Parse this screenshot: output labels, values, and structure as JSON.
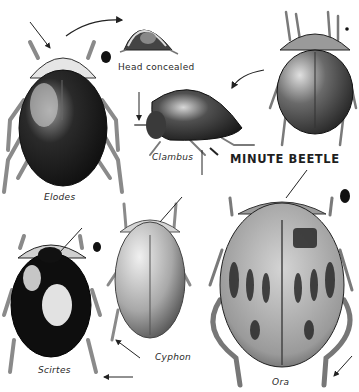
{
  "plate": {
    "title": "MINUTE BEETLE",
    "labels": {
      "head_concealed": "Head concealed",
      "clambus": "Clambus",
      "elodes": "Elodes",
      "scirtes": "Scirtes",
      "cyphon": "Cyphon",
      "ora": "Ora"
    },
    "colors": {
      "ink": "#1a1a1a",
      "mid_gray": "#6e6e6e",
      "light_gray": "#c9c9c9",
      "paper": "#ffffff"
    }
  }
}
